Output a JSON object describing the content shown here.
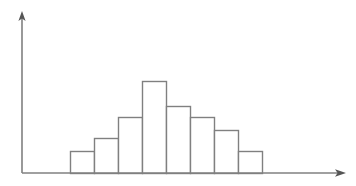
{
  "figure": {
    "name": "histogram-figure",
    "background_color": "#ffffff",
    "line_color": "#808080",
    "axis_color": "#808080",
    "width": 356,
    "height": 186
  },
  "axes": {
    "origin_x": 22,
    "baseline_y": 173,
    "y_axis_top_y": 13,
    "x_axis_right_x": 345,
    "x_axis_label": "",
    "y_axis_label": "",
    "has_arrowheads": true,
    "has_tick_labels": false,
    "has_gridlines": false
  },
  "chart_data": {
    "type": "bar",
    "title": "",
    "subtitle": "",
    "xlabel": "",
    "ylabel": "",
    "categories": [
      "1",
      "2",
      "3",
      "4",
      "5",
      "6",
      "7",
      "8"
    ],
    "values": [
      22,
      35,
      56,
      92,
      67,
      56,
      43,
      22
    ],
    "bar_pixel_tops": [
      151,
      138,
      117,
      81,
      106,
      117,
      130,
      151
    ],
    "bar_pixel_left_edges": [
      70,
      94,
      118,
      142,
      166,
      190,
      214,
      238
    ],
    "bar_width_px": 24,
    "baseline_px": 173,
    "xlim": [
      0,
      8
    ],
    "ylim": [
      0,
      160
    ],
    "grid": false,
    "legend": [],
    "legend_position": "none",
    "annotations": [],
    "tick_labels_x": [],
    "tick_labels_y": [],
    "bar_fill": "#ffffff",
    "bar_stroke": "#808080"
  }
}
